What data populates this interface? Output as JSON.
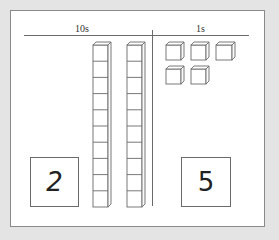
{
  "diagram": {
    "type": "place-value base-ten blocks",
    "columns": [
      {
        "header": "10s",
        "blocks": 2,
        "block_type": "rod (10 units each)",
        "digit": "2"
      },
      {
        "header": "1s",
        "blocks": 5,
        "block_type": "unit cube",
        "digit": "5"
      }
    ],
    "represented_number": 25
  },
  "labels": {
    "tens_header": "10s",
    "ones_header": "1s",
    "tens_digit": "2",
    "ones_digit": "5"
  },
  "colors": {
    "background": "#e4e4e4",
    "paper": "#ffffff",
    "line": "#6a6a6a"
  }
}
